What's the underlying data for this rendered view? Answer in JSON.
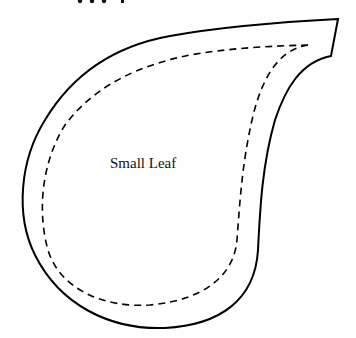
{
  "pattern": {
    "label": "Small Leaf",
    "top_cut_text": "ppg",
    "outline_color": "#000000",
    "stitch_line_style": "dashed"
  }
}
